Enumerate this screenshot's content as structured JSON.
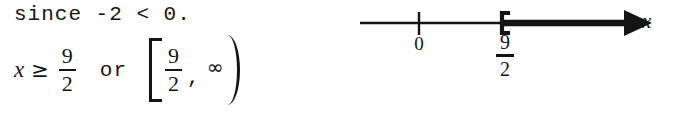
{
  "document": {
    "type": "handwritten-math-solution-scan",
    "background_color": "#ffffff",
    "ink_color": "#141414"
  },
  "work": {
    "reason_line": "since -2 < 0.",
    "variable": "x",
    "relation": "≥",
    "solution_fraction": {
      "numerator": "9",
      "denominator": "2"
    },
    "connector": "or",
    "interval": {
      "left_bracket": "[",
      "lower_fraction": {
        "numerator": "9",
        "denominator": "2"
      },
      "separator": ",",
      "upper_bound": "∞",
      "right_bracket": ")"
    }
  },
  "number_line": {
    "axis_label": "x",
    "ticks": [
      {
        "label": "0",
        "kind": "plain-tick"
      },
      {
        "label_numerator": "9",
        "label_denominator": "2",
        "kind": "closed-bracket"
      }
    ],
    "shaded_direction": "right",
    "arrow_head": "right-solid-triangle",
    "endpoint_included": true
  }
}
